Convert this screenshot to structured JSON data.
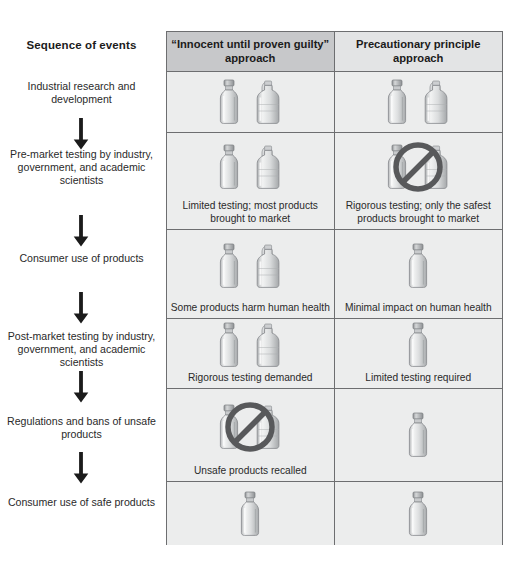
{
  "sequence": {
    "title": "Sequence of events",
    "steps": [
      {
        "label": "Industrial research and development"
      },
      {
        "label": "Pre-market testing by industry, government, and academic scientists"
      },
      {
        "label": "Consumer use of products"
      },
      {
        "label": "Post-market testing by industry, government, and academic scientists"
      },
      {
        "label": "Regulations and bans of unsafe products"
      },
      {
        "label": "Consumer use of safe products"
      }
    ],
    "arrow_count": 5,
    "arrow_icon": "down-arrow-icon"
  },
  "matrix": {
    "columns": [
      {
        "id": "innocent",
        "label": "“Innocent until proven guilty” approach",
        "header_bg": "#c7c8ca"
      },
      {
        "id": "precautionary",
        "label": "Precautionary principle approach",
        "header_bg": "#e3e4e5"
      }
    ],
    "rows": [
      {
        "step": "Industrial research and development",
        "innocent": {
          "caption": "",
          "items": [
            "bottle-icon",
            "jug-icon"
          ],
          "banned": false
        },
        "precautionary": {
          "caption": "",
          "items": [
            "bottle-icon",
            "jug-icon"
          ],
          "banned": false
        }
      },
      {
        "step": "Pre-market testing by industry, government, and academic scientists",
        "innocent": {
          "caption": "Limited testing; most products brought to market",
          "items": [
            "bottle-icon",
            "jug-icon"
          ],
          "banned": false
        },
        "precautionary": {
          "caption": "Rigorous testing; only the safest products brought to market",
          "items": [
            "bottle-icon",
            "jug-icon"
          ],
          "banned": true
        }
      },
      {
        "step": "Consumer use of products",
        "innocent": {
          "caption": "Some products harm human health",
          "items": [
            "bottle-icon",
            "jug-icon"
          ],
          "banned": false
        },
        "precautionary": {
          "caption": "Minimal impact on human health",
          "items": [
            "bottle-icon"
          ],
          "banned": false
        }
      },
      {
        "step": "Post-market testing by industry, government, and academic scientists",
        "innocent": {
          "caption": "Rigorous testing demanded",
          "items": [
            "bottle-icon",
            "jug-icon"
          ],
          "banned": false
        },
        "precautionary": {
          "caption": "Limited testing required",
          "items": [
            "bottle-icon"
          ],
          "banned": false
        }
      },
      {
        "step": "Regulations and bans of unsafe products",
        "innocent": {
          "caption": "Unsafe products recalled",
          "items": [
            "bottle-icon",
            "jug-icon"
          ],
          "banned": true
        },
        "precautionary": {
          "caption": "",
          "items": [
            "bottle-icon"
          ],
          "banned": false
        }
      },
      {
        "step": "Consumer use of safe products",
        "innocent": {
          "caption": "",
          "items": [
            "bottle-icon"
          ],
          "banned": false
        },
        "precautionary": {
          "caption": "",
          "items": [
            "bottle-icon"
          ],
          "banned": false
        }
      }
    ]
  },
  "colors": {
    "border": "#6d6e70",
    "cell_bg": "#eceded",
    "header_dark": "#c7c8ca",
    "header_light": "#e3e4e5",
    "text": "#2a2a2a",
    "slash": "#58595b"
  },
  "layout": {
    "row_heights": [
      61,
      97,
      89,
      70,
      93,
      63
    ],
    "step_tops": [
      80,
      148,
      252,
      330,
      410,
      487
    ],
    "arrow_tops": [
      118,
      215,
      300,
      373,
      452
    ]
  }
}
